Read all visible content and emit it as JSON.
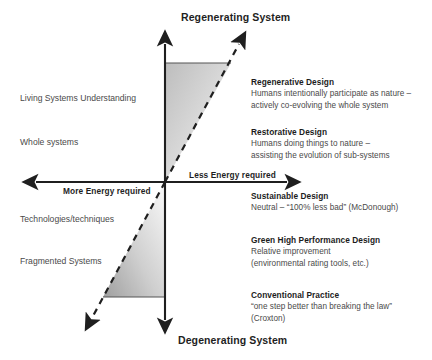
{
  "figure": {
    "type": "conceptual-quadrant-diagram",
    "background_color": "#ffffff",
    "accent_color": "#1f1f1f",
    "gradient_color": "#c9c9c9"
  },
  "axes": {
    "vertical_top_title": "Regenerating System",
    "vertical_bottom_title": "Degenerating System",
    "horizontal_right_label": "Less Energy required",
    "horizontal_left_label": "More Energy required"
  },
  "left_labels": [
    {
      "text": "Living Systems Understanding"
    },
    {
      "text": "Whole systems"
    },
    {
      "text": "Technologies/techniques"
    },
    {
      "text": "Fragmented Systems"
    }
  ],
  "stages": [
    {
      "title": "Regenerative Design",
      "lines": [
        "Humans intentionally participate as nature –",
        "actively co-evolving the whole system"
      ]
    },
    {
      "title": "Restorative Design",
      "lines": [
        "Humans doing things to nature –",
        "assisting the evolution of sub-systems"
      ]
    },
    {
      "title": "Sustainable Design",
      "lines": [
        "Neutral – “100% less bad” (McDonough)"
      ]
    },
    {
      "title": "Green High Performance Design",
      "lines": [
        "Relative improvement",
        "(environmental rating tools, etc.)"
      ]
    },
    {
      "title": "Conventional Practice",
      "lines": [
        "“one step better than breaking the law”",
        "(Croxton)"
      ]
    }
  ]
}
